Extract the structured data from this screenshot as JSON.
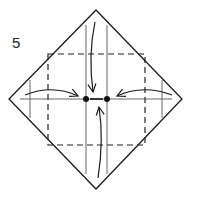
{
  "diagram": {
    "step_number": "5",
    "type": "origami-fold-instruction",
    "colors": {
      "line": "#1a1a1a",
      "crease": "#555555",
      "dashed": "#222222",
      "background": "#ffffff"
    },
    "elements": {
      "outline": "diamond",
      "valley_fold_square": "dashed square",
      "crease_lines": [
        "vertical-left",
        "vertical-right",
        "horizontal-center",
        "short-left",
        "short-right"
      ],
      "arrows": [
        "left-to-center",
        "right-to-center",
        "top-to-center",
        "bottom-to-center"
      ],
      "reference_points": 2
    }
  }
}
